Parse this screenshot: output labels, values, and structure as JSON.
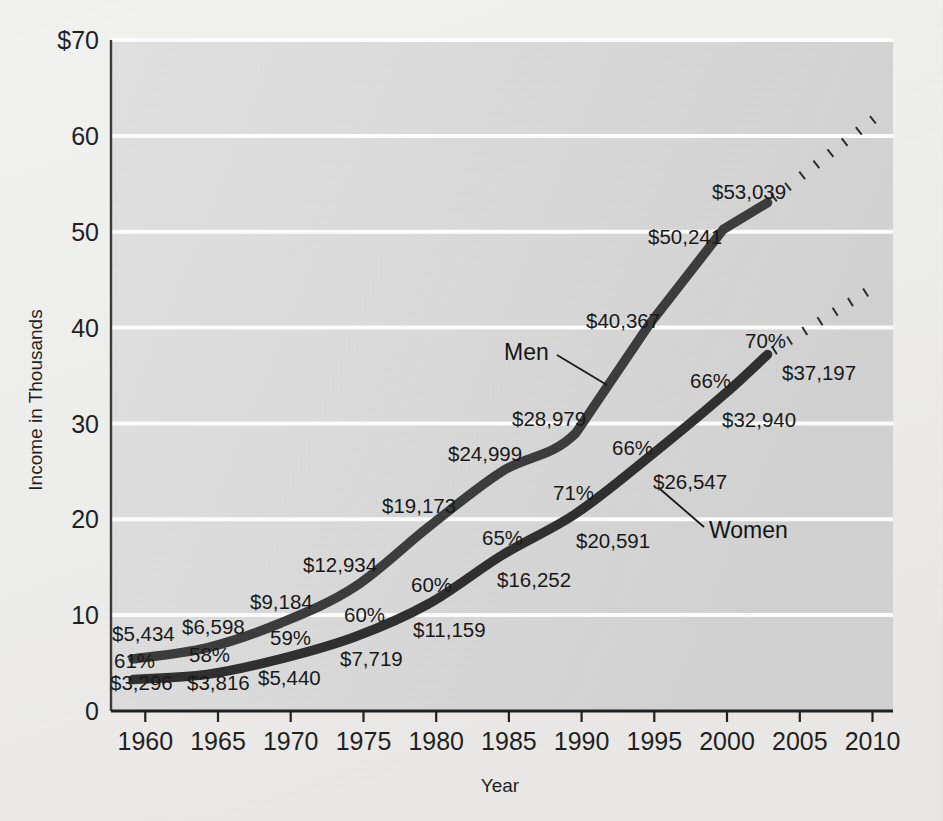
{
  "chart_data": {
    "type": "line",
    "title": "",
    "xlabel": "Year",
    "ylabel": "Income in Thousands",
    "xlim": [
      1958.5,
      2011.5
    ],
    "ylim": [
      0,
      70
    ],
    "grid": true,
    "legend_position": "inline-annotations",
    "x_ticks": [
      "1960",
      "1965",
      "1970",
      "1975",
      "1980",
      "1985",
      "1990",
      "1995",
      "2000",
      "2005",
      "2010"
    ],
    "y_ticks": [
      "0",
      "10",
      "20",
      "30",
      "40",
      "50",
      "60",
      "$70"
    ],
    "x": [
      1960,
      1965,
      1970,
      1975,
      1980,
      1985,
      1990,
      1995,
      2000,
      2003
    ],
    "series": [
      {
        "name": "Men",
        "values": [
          5434,
          6598,
          9184,
          12934,
          19173,
          24999,
          28979,
          40367,
          50241,
          53039
        ],
        "labels": [
          "$5,434",
          "$6,598",
          "$9,184",
          "$12,934",
          "$19,173",
          "$24,999",
          "$28,979",
          "$40,367",
          "$50,241",
          "$53,039"
        ],
        "projection": {
          "from_x": 2003,
          "from_y": 53039,
          "to_x": 2010.4,
          "to_y": 62000,
          "style": "dotted"
        }
      },
      {
        "name": "Women",
        "values": [
          3296,
          3816,
          5440,
          7719,
          11159,
          16252,
          20591,
          26547,
          32940,
          37197
        ],
        "labels": [
          "$3,296",
          "$3,816",
          "$5,440",
          "$7,719",
          "$11,159",
          "$16,252",
          "$20,591",
          "$26,547",
          "$32,940",
          "$37,197"
        ],
        "ratio_labels": [
          "61%",
          "58%",
          "59%",
          "60%",
          "60%",
          "65%",
          "71%",
          "66%",
          "66%",
          "70%"
        ],
        "projection": {
          "from_x": 2003,
          "from_y": 37197,
          "to_x": 2010.4,
          "to_y": 44400,
          "style": "dotted"
        }
      }
    ]
  },
  "axis": {
    "y_title": "Income in Thousands",
    "x_title": "Year",
    "y_ticks": [
      {
        "label": "$70",
        "value": 70
      },
      {
        "label": "60",
        "value": 60
      },
      {
        "label": "50",
        "value": 50
      },
      {
        "label": "40",
        "value": 40
      },
      {
        "label": "30",
        "value": 30
      },
      {
        "label": "20",
        "value": 20
      },
      {
        "label": "10",
        "value": 10
      },
      {
        "label": "0",
        "value": 0
      }
    ],
    "x_ticks": [
      {
        "label": "1960",
        "value": 1960
      },
      {
        "label": "1965",
        "value": 1965
      },
      {
        "label": "1970",
        "value": 1970
      },
      {
        "label": "1975",
        "value": 1975
      },
      {
        "label": "1980",
        "value": 1980
      },
      {
        "label": "1985",
        "value": 1985
      },
      {
        "label": "1990",
        "value": 1990
      },
      {
        "label": "1995",
        "value": 1995
      },
      {
        "label": "2000",
        "value": 2000
      },
      {
        "label": "2005",
        "value": 2005
      },
      {
        "label": "2010",
        "value": 2010
      }
    ]
  },
  "annotations": {
    "men_label": "Men",
    "women_label": "Women",
    "men_values": [
      {
        "text": "$5,434",
        "x": 112,
        "y": 641,
        "anchor": "start"
      },
      {
        "text": "$6,598",
        "x": 182,
        "y": 634,
        "anchor": "start"
      },
      {
        "text": "$9,184",
        "x": 250,
        "y": 609,
        "anchor": "start"
      },
      {
        "text": "$12,934",
        "x": 303,
        "y": 572,
        "anchor": "start"
      },
      {
        "text": "$19,173",
        "x": 382,
        "y": 513,
        "anchor": "start"
      },
      {
        "text": "$24,999",
        "x": 448,
        "y": 461,
        "anchor": "start"
      },
      {
        "text": "$28,979",
        "x": 512,
        "y": 426,
        "anchor": "start"
      },
      {
        "text": "$40,367",
        "x": 586,
        "y": 328,
        "anchor": "start"
      },
      {
        "text": "$50,241",
        "x": 648,
        "y": 244,
        "anchor": "start"
      },
      {
        "text": "$53,039",
        "x": 712,
        "y": 199,
        "anchor": "start"
      }
    ],
    "women_values": [
      {
        "text": "$3,296",
        "x": 110,
        "y": 690,
        "anchor": "start"
      },
      {
        "text": "$3,816",
        "x": 187,
        "y": 690,
        "anchor": "start"
      },
      {
        "text": "$5,440",
        "x": 258,
        "y": 685,
        "anchor": "start"
      },
      {
        "text": "$7,719",
        "x": 340,
        "y": 666,
        "anchor": "start"
      },
      {
        "text": "$11,159",
        "x": 413,
        "y": 637,
        "anchor": "start"
      },
      {
        "text": "$16,252",
        "x": 497,
        "y": 587,
        "anchor": "start"
      },
      {
        "text": "$20,591",
        "x": 576,
        "y": 548,
        "anchor": "start"
      },
      {
        "text": "$26,547",
        "x": 653,
        "y": 489,
        "anchor": "start"
      },
      {
        "text": "$32,940",
        "x": 722,
        "y": 427,
        "anchor": "start"
      },
      {
        "text": "$37,197",
        "x": 782,
        "y": 380,
        "anchor": "start"
      }
    ],
    "ratios": [
      {
        "text": "61%",
        "x": 114,
        "y": 668,
        "anchor": "start"
      },
      {
        "text": "58%",
        "x": 189,
        "y": 662,
        "anchor": "start"
      },
      {
        "text": "59%",
        "x": 270,
        "y": 645,
        "anchor": "start"
      },
      {
        "text": "60%",
        "x": 344,
        "y": 622,
        "anchor": "start"
      },
      {
        "text": "60%",
        "x": 411,
        "y": 592,
        "anchor": "start"
      },
      {
        "text": "65%",
        "x": 482,
        "y": 545,
        "anchor": "start"
      },
      {
        "text": "71%",
        "x": 553,
        "y": 500,
        "anchor": "start"
      },
      {
        "text": "66%",
        "x": 612,
        "y": 455,
        "anchor": "start"
      },
      {
        "text": "66%",
        "x": 690,
        "y": 388,
        "anchor": "start"
      },
      {
        "text": "70%",
        "x": 745,
        "y": 348,
        "anchor": "start"
      }
    ]
  }
}
